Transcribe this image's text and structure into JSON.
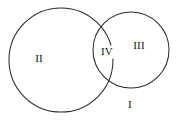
{
  "figure": {
    "background_color": "#ffffff",
    "stroke_color": "#2b2b2b",
    "label_color": "#141414",
    "width": 181,
    "height": 130
  },
  "chart_data": {
    "type": "diagram",
    "subtype": "venn",
    "title": "",
    "background": "#ffffff",
    "set_count": 2,
    "circles": [
      {
        "id": "left-circle",
        "label": "II",
        "cx": 61,
        "cy": 60,
        "r": 52,
        "fill": "none",
        "stroke": "#2b2b2b"
      },
      {
        "id": "right-circle",
        "label": "III",
        "cx": 131,
        "cy": 50,
        "r": 38,
        "fill": "none",
        "stroke": "#2b2b2b"
      }
    ],
    "regions": [
      {
        "id": "region-i",
        "label": "I",
        "description": "universe outside both circles",
        "shaded": false,
        "label_x": 130,
        "label_y": 105
      },
      {
        "id": "region-ii",
        "label": "II",
        "description": "left circle only",
        "shaded": false,
        "label_x": 39,
        "label_y": 59
      },
      {
        "id": "region-iii",
        "label": "III",
        "description": "right circle only",
        "shaded": false,
        "label_x": 139,
        "label_y": 46
      },
      {
        "id": "region-iv",
        "label": "IV",
        "description": "intersection of both circles, hatched with horizontal lines",
        "shaded": true,
        "hatch": "horizontal",
        "hatch_line_count": 13,
        "label_x": 107,
        "label_y": 52
      }
    ],
    "intersection": {
      "top_point": {
        "x": 103,
        "y": 25
      },
      "bottom_point": {
        "x": 107,
        "y": 78
      }
    }
  },
  "labels": {
    "region_i": "I",
    "region_ii": "II",
    "region_iii": "III",
    "region_iv": "IV"
  }
}
